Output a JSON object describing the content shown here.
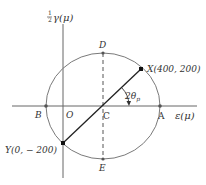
{
  "diagram": {
    "type": "mohr-circle",
    "y_axis_label": {
      "fraction": "1/2",
      "symbol": "γ(μ)",
      "full": "½γ(μ)"
    },
    "x_axis_label": "ε(μ)",
    "points": {
      "origin": "O",
      "center": "C",
      "A": "A",
      "B": "B",
      "D": "D",
      "E": "E",
      "X": "X(400, 200)",
      "Y": "Y(0, − 200)"
    },
    "angle_label": {
      "base": "2θ",
      "sub": "p"
    },
    "colors": {
      "axis": "#555555",
      "circle": "#777777",
      "diameter": "#222222",
      "dashed": "#555555",
      "point": "#111111",
      "text": "#333333"
    }
  }
}
